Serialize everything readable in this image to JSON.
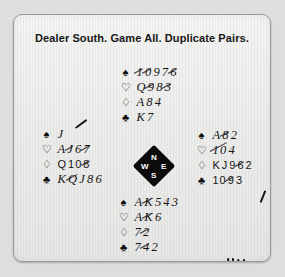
{
  "title": "Dealer South. Game All. Duplicate Pairs.",
  "suits": {
    "spade": "♠",
    "heart": "♡",
    "diamond": "♢",
    "club": "♣"
  },
  "compass": {
    "north": "N",
    "east": "E",
    "south": "S",
    "west": "W"
  },
  "hands": {
    "north": {
      "label": "North",
      "spades": "10 9 7 6",
      "hearts": "Q 9 8 3",
      "diamonds": "A 8 4",
      "clubs": "K 7"
    },
    "west": {
      "label": "West",
      "spades": "J",
      "hearts": "A J 6 7",
      "diamonds": "Q 10 8",
      "clubs": "K Q J 8 6"
    },
    "east": {
      "label": "East",
      "spades": "A 8 2",
      "hearts": "10 4",
      "diamonds": "K J 9 6 2",
      "clubs": "10 9 3"
    },
    "south": {
      "label": "South",
      "spades": "A K 5 4 3",
      "hearts": "A K 6",
      "diamonds": "7 2",
      "clubs": "7 4 2"
    }
  },
  "annotations": {
    "tally_marks": "1 1111",
    "stray_stroke": "pen-stroke"
  }
}
